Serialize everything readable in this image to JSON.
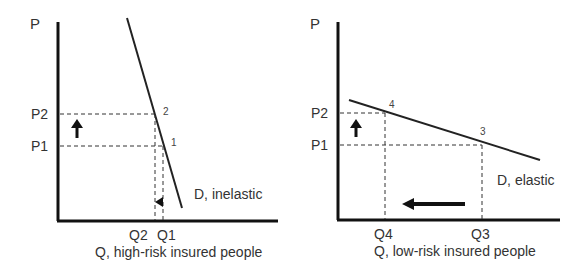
{
  "left_panel": {
    "y_axis_label": "P",
    "x_axis_label": "Q, high-risk insured people",
    "price_labels": {
      "p2": "P2",
      "p1": "P1"
    },
    "quantity_labels": {
      "q2": "Q2",
      "q1": "Q1"
    },
    "point_labels": {
      "p2": "2",
      "p1": "1"
    },
    "curve_label": "D, inelastic"
  },
  "right_panel": {
    "y_axis_label": "P",
    "x_axis_label": "Q, low-risk insured people",
    "price_labels": {
      "p2": "P2",
      "p1": "P1"
    },
    "quantity_labels": {
      "q4": "Q4",
      "q3": "Q3"
    },
    "point_labels": {
      "p4": "4",
      "p3": "3"
    },
    "curve_label": "D, elastic"
  },
  "colors": {
    "line": "#222222",
    "text": "#333333",
    "background": "#ffffff"
  }
}
